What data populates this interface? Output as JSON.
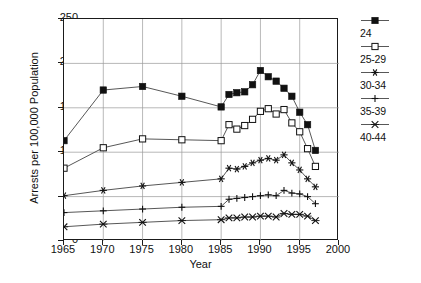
{
  "chart_data": {
    "type": "line",
    "title": "",
    "xlabel": "Year",
    "ylabel": "Arrests per 100,000 Population",
    "xlim": [
      1965,
      2000
    ],
    "ylim": [
      0,
      250
    ],
    "xticks": [
      1965,
      1970,
      1975,
      1980,
      1985,
      1990,
      1995,
      2000
    ],
    "yticks": [
      0,
      50,
      100,
      150,
      200,
      250
    ],
    "grid": true,
    "legend_position": "right",
    "series": [
      {
        "name": "24",
        "marker": "filled-square",
        "x": [
          1965,
          1970,
          1975,
          1980,
          1985,
          1986,
          1987,
          1988,
          1989,
          1990,
          1991,
          1992,
          1993,
          1994,
          1995,
          1996,
          1997
        ],
        "values": [
          113,
          170,
          174,
          163,
          151,
          165,
          167,
          168,
          176,
          192,
          185,
          180,
          172,
          163,
          145,
          131,
          102
        ]
      },
      {
        "name": "25-29",
        "marker": "open-square",
        "x": [
          1965,
          1970,
          1975,
          1980,
          1985,
          1986,
          1987,
          1988,
          1989,
          1990,
          1991,
          1992,
          1993,
          1994,
          1995,
          1996,
          1997
        ],
        "values": [
          82,
          105,
          115,
          114,
          113,
          131,
          126,
          130,
          137,
          146,
          149,
          143,
          148,
          133,
          123,
          104,
          84
        ]
      },
      {
        "name": "30-34",
        "marker": "asterisk",
        "x": [
          1965,
          1970,
          1975,
          1980,
          1985,
          1986,
          1987,
          1988,
          1989,
          1990,
          1991,
          1992,
          1993,
          1994,
          1995,
          1996,
          1997
        ],
        "values": [
          51,
          57,
          62,
          66,
          70,
          82,
          81,
          84,
          88,
          91,
          93,
          91,
          97,
          88,
          80,
          70,
          61
        ]
      },
      {
        "name": "35-39",
        "marker": "plus",
        "x": [
          1965,
          1970,
          1975,
          1980,
          1985,
          1986,
          1987,
          1988,
          1989,
          1990,
          1991,
          1992,
          1993,
          1994,
          1995,
          1996,
          1997
        ],
        "values": [
          32,
          34,
          36,
          38,
          39,
          47,
          48,
          49,
          50,
          51,
          52,
          51,
          57,
          54,
          53,
          50,
          42
        ]
      },
      {
        "name": "40-44",
        "marker": "cross",
        "x": [
          1965,
          1970,
          1975,
          1980,
          1985,
          1986,
          1987,
          1988,
          1989,
          1990,
          1991,
          1992,
          1993,
          1994,
          1995,
          1996,
          1997
        ],
        "values": [
          16,
          19,
          21,
          23,
          24,
          26,
          26,
          27,
          27,
          28,
          28,
          27,
          31,
          30,
          30,
          28,
          23
        ]
      }
    ]
  },
  "colors": {
    "axis": "#1a1a1a",
    "grid": "#9a9a9a",
    "line": "#444444",
    "marker": "#111111",
    "background": "#ffffff"
  }
}
